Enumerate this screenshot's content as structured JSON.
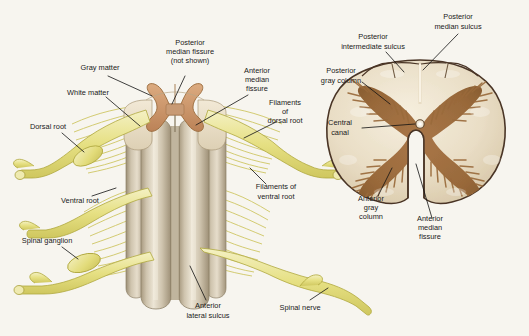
{
  "figure": {
    "background_color": "#f7f5ef",
    "label_color": "#1a1a1a"
  },
  "palette": {
    "white_matter": "#ded2b8",
    "white_matter_light": "#f0e7d5",
    "gray_matter_tan": "#c89a74",
    "gray_matter_brown": "#9a6b3c",
    "cord_column": "#cfc4ae",
    "cord_column_light": "#e8e0cf",
    "cord_column_dark": "#a89a80",
    "nerve_yellow": "#e8e38a",
    "nerve_yellow_light": "#f2efb9",
    "nerve_outline": "#b0a83f",
    "section_outline": "#4a3526",
    "central_canal": "#ffffff"
  },
  "left_panel": {
    "name": "spinal-cord-dorsal-view",
    "labels": [
      {
        "id": "gray-matter",
        "lines": [
          "Gray matter"
        ],
        "x": 100,
        "y": 68,
        "anchor": "middle"
      },
      {
        "id": "posterior-median-fissure",
        "lines": [
          "Posterior",
          "median fissure",
          "(not shown)"
        ],
        "x": 190,
        "y": 52,
        "anchor": "middle"
      },
      {
        "id": "white-matter",
        "lines": [
          "White matter"
        ],
        "x": 88,
        "y": 93,
        "anchor": "middle"
      },
      {
        "id": "anterior-median-fissure",
        "lines": [
          "Anterior",
          "median",
          "fissure"
        ],
        "x": 257,
        "y": 80,
        "anchor": "middle"
      },
      {
        "id": "dorsal-root",
        "lines": [
          "Dorsal root"
        ],
        "x": 48,
        "y": 127,
        "anchor": "middle"
      },
      {
        "id": "filaments-of-dorsal-root",
        "lines": [
          "Filaments",
          "of",
          "dorsal root"
        ],
        "x": 285,
        "y": 112,
        "anchor": "middle"
      },
      {
        "id": "ventral-root",
        "lines": [
          "Ventral root"
        ],
        "x": 80,
        "y": 201,
        "anchor": "middle"
      },
      {
        "id": "filaments-of-ventral-root",
        "lines": [
          "Filaments of",
          "ventral root"
        ],
        "x": 276,
        "y": 192,
        "anchor": "middle"
      },
      {
        "id": "spinal-ganglion",
        "lines": [
          "Spinal ganglion"
        ],
        "x": 47,
        "y": 241,
        "anchor": "middle"
      },
      {
        "id": "anterior-lateral-sulcus",
        "lines": [
          "Anterior",
          "lateral sulcus"
        ],
        "x": 208,
        "y": 311,
        "anchor": "middle"
      },
      {
        "id": "spinal-nerve",
        "lines": [
          "Spinal nerve"
        ],
        "x": 300,
        "y": 308,
        "anchor": "middle"
      }
    ]
  },
  "right_panel": {
    "name": "spinal-cord-transverse-section",
    "labels": [
      {
        "id": "posterior-intermediate-sulcus",
        "lines": [
          "Posterior",
          "intermediate sulcus"
        ],
        "x": 373,
        "y": 42,
        "anchor": "middle"
      },
      {
        "id": "posterior-median-sulcus",
        "lines": [
          "Posterior",
          "median sulcus"
        ],
        "x": 458,
        "y": 22,
        "anchor": "middle"
      },
      {
        "id": "posterior-gray-column",
        "lines": [
          "Posterior",
          "gray column"
        ],
        "x": 341,
        "y": 76,
        "anchor": "middle"
      },
      {
        "id": "central-canal",
        "lines": [
          "Central",
          "canal"
        ],
        "x": 340,
        "y": 128,
        "anchor": "middle"
      },
      {
        "id": "anterior-gray-column",
        "lines": [
          "Anterior",
          "gray",
          "column"
        ],
        "x": 371,
        "y": 208,
        "anchor": "middle"
      },
      {
        "id": "anterior-median-fissure",
        "lines": [
          "Anterior",
          "median",
          "fissure"
        ],
        "x": 430,
        "y": 228,
        "anchor": "middle"
      }
    ]
  }
}
